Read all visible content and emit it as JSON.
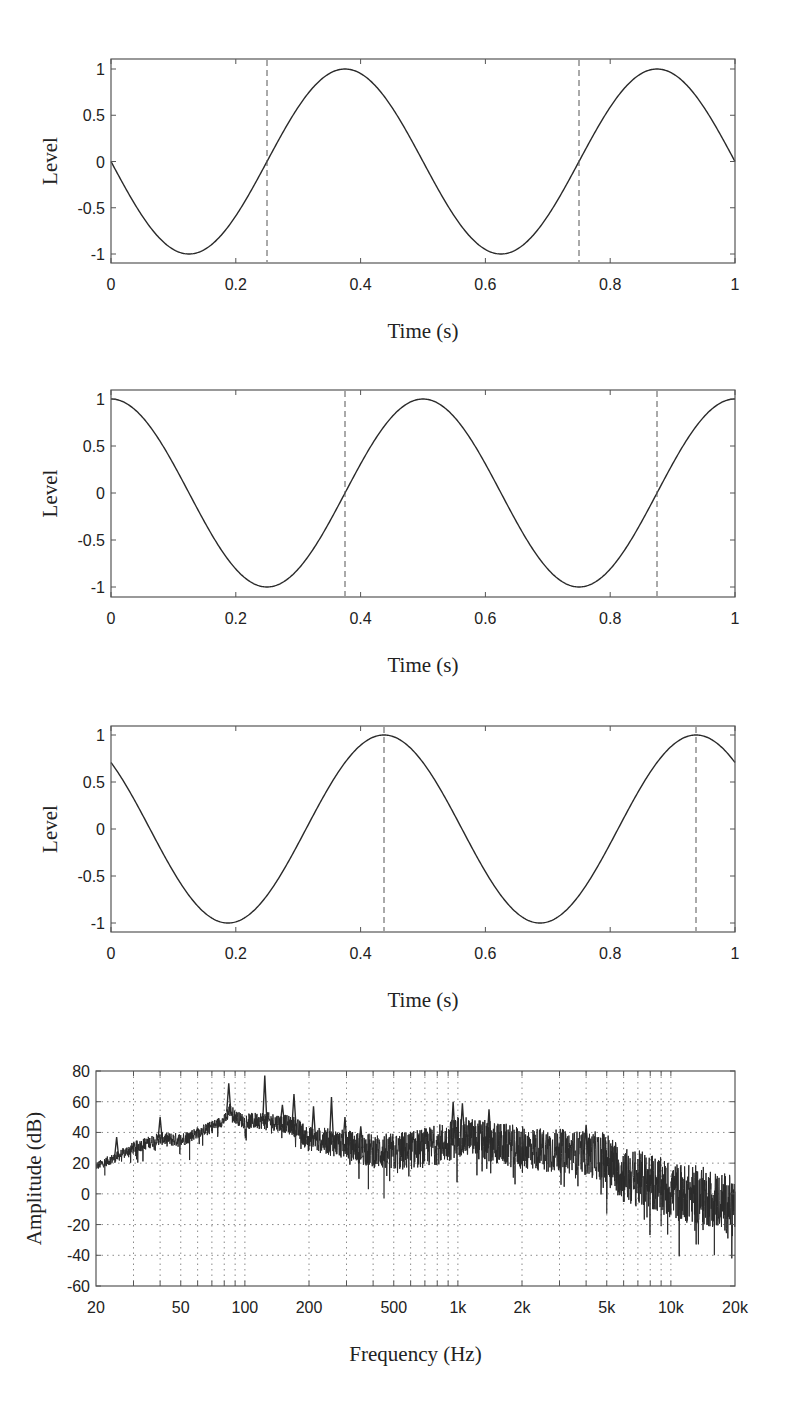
{
  "figure": {
    "width": 798,
    "height": 1401
  },
  "chart_data": [
    {
      "type": "line",
      "id": "waveform-1",
      "title": "",
      "xlabel": "Time (s)",
      "ylabel": "Level",
      "xlim": [
        0,
        1
      ],
      "ylim": [
        -1.1,
        1.1
      ],
      "xticks": [
        0,
        0.2,
        0.4,
        0.6,
        0.8,
        1
      ],
      "xtick_labels": [
        "0",
        "0.2",
        "0.4",
        "0.6",
        "0.8",
        "1"
      ],
      "yticks": [
        1,
        0.5,
        0,
        -0.5,
        -1
      ],
      "ytick_labels": [
        "1",
        "0.5",
        "0",
        "-0.5",
        "-1"
      ],
      "grid": false,
      "series": [
        {
          "name": "signal",
          "function": "-sin(2*pi*2*t)",
          "frequency_hz": 2,
          "amplitude": 1,
          "phase_rad": 3.14159265,
          "x": [
            0,
            0.125,
            0.25,
            0.375,
            0.5,
            0.625,
            0.75,
            0.875,
            1
          ],
          "values": [
            0,
            -1,
            0,
            1,
            0,
            -1,
            0,
            1,
            0
          ]
        }
      ],
      "markers": {
        "style": "dashed-vertical",
        "x": [
          0.25,
          0.75
        ]
      },
      "box": {
        "left": 111,
        "top": 59,
        "right": 735,
        "bottom": 263,
        "y_at_top_tick": 69,
        "y_at_bottom_tick": 254
      }
    },
    {
      "type": "line",
      "id": "waveform-2",
      "title": "",
      "xlabel": "Time (s)",
      "ylabel": "Level",
      "xlim": [
        0,
        1
      ],
      "ylim": [
        -1.1,
        1.1
      ],
      "xticks": [
        0,
        0.2,
        0.4,
        0.6,
        0.8,
        1
      ],
      "xtick_labels": [
        "0",
        "0.2",
        "0.4",
        "0.6",
        "0.8",
        "1"
      ],
      "yticks": [
        1,
        0.5,
        0,
        -0.5,
        -1
      ],
      "ytick_labels": [
        "1",
        "0.5",
        "0",
        "-0.5",
        "-1"
      ],
      "grid": false,
      "series": [
        {
          "name": "signal",
          "function": "cos(2*pi*2*t)",
          "frequency_hz": 2,
          "amplitude": 1,
          "phase_rad": 1.57079633,
          "x": [
            0,
            0.125,
            0.25,
            0.375,
            0.5,
            0.625,
            0.75,
            0.875,
            1
          ],
          "values": [
            1,
            0,
            -1,
            0,
            1,
            0,
            -1,
            0,
            1
          ]
        }
      ],
      "markers": {
        "style": "dashed-vertical",
        "x": [
          0.375,
          0.875
        ]
      },
      "box": {
        "left": 111,
        "top": 390,
        "right": 735,
        "bottom": 597,
        "y_at_top_tick": 399,
        "y_at_bottom_tick": 587
      }
    },
    {
      "type": "line",
      "id": "waveform-3",
      "title": "",
      "xlabel": "Time (s)",
      "ylabel": "Level",
      "xlim": [
        0,
        1
      ],
      "ylim": [
        -1.1,
        1.1
      ],
      "xticks": [
        0,
        0.2,
        0.4,
        0.6,
        0.8,
        1
      ],
      "xtick_labels": [
        "0",
        "0.2",
        "0.4",
        "0.6",
        "0.8",
        "1"
      ],
      "yticks": [
        1,
        0.5,
        0,
        -0.5,
        -1
      ],
      "ytick_labels": [
        "1",
        "0.5",
        "0",
        "-0.5",
        "-1"
      ],
      "grid": false,
      "series": [
        {
          "name": "signal",
          "function": "sin(2*pi*2*t + 3*pi/4)",
          "frequency_hz": 2,
          "amplitude": 1,
          "phase_rad": 2.35619449,
          "x": [
            0,
            0.0625,
            0.1875,
            0.3125,
            0.4375,
            0.5625,
            0.6875,
            0.8125,
            0.9375,
            1
          ],
          "values": [
            0.707,
            1,
            0,
            -1,
            0,
            1,
            0,
            -1,
            0,
            0.707
          ]
        }
      ],
      "markers": {
        "style": "dashed-vertical",
        "x": [
          0.4375,
          0.9375
        ]
      },
      "box": {
        "left": 111,
        "top": 726,
        "right": 735,
        "bottom": 932,
        "y_at_top_tick": 735,
        "y_at_bottom_tick": 923
      }
    },
    {
      "type": "line",
      "id": "spectrum",
      "title": "",
      "xlabel": "Frequency (Hz)",
      "ylabel": "Amplitude (dB)",
      "xscale": "log",
      "xlim": [
        20,
        20000
      ],
      "ylim": [
        -60,
        80
      ],
      "xticks": [
        20,
        50,
        100,
        200,
        500,
        1000,
        2000,
        5000,
        10000,
        20000
      ],
      "xtick_labels": [
        "20",
        "50",
        "100",
        "200",
        "500",
        "1k",
        "2k",
        "5k",
        "10k",
        "20k"
      ],
      "yticks": [
        80,
        60,
        40,
        20,
        0,
        -20,
        -40,
        -60
      ],
      "ytick_labels": [
        "80",
        "60",
        "40",
        "20",
        "0",
        "-20",
        "-40",
        "-60"
      ],
      "grid": true,
      "grid_style": "dotted",
      "minor_grid_x": [
        30,
        40,
        50,
        60,
        70,
        80,
        90,
        100,
        200,
        300,
        400,
        500,
        600,
        700,
        800,
        900,
        1000,
        2000,
        3000,
        4000,
        5000,
        6000,
        7000,
        8000,
        9000,
        10000
      ],
      "series": [
        {
          "name": "amplitude",
          "envelope": {
            "x": [
              20,
              25,
              30,
              40,
              50,
              60,
              70,
              80,
              85,
              90,
              100,
              120,
              150,
              170,
              200,
              300,
              400,
              500,
              700,
              900,
              1000,
              1500,
              2000,
              3000,
              4000,
              5000,
              6000,
              8000,
              10000,
              15000,
              20000
            ],
            "mean": [
              18,
              24,
              30,
              36,
              35,
              40,
              44,
              48,
              55,
              50,
              47,
              48,
              46,
              44,
              36,
              32,
              28,
              27,
              30,
              34,
              38,
              33,
              30,
              28,
              26,
              24,
              12,
              8,
              2,
              -2,
              -8
            ],
            "spread": [
              5,
              6,
              7,
              7,
              8,
              6,
              6,
              6,
              8,
              7,
              8,
              9,
              9,
              10,
              12,
              14,
              16,
              18,
              18,
              18,
              18,
              18,
              18,
              18,
              18,
              20,
              22,
              22,
              22,
              22,
              22
            ]
          },
          "peaks": [
            {
              "x": 25,
              "value": 37
            },
            {
              "x": 40,
              "value": 50
            },
            {
              "x": 84,
              "value": 72
            },
            {
              "x": 124,
              "value": 77
            },
            {
              "x": 150,
              "value": 58
            },
            {
              "x": 170,
              "value": 65
            },
            {
              "x": 210,
              "value": 57
            },
            {
              "x": 255,
              "value": 63
            },
            {
              "x": 295,
              "value": 50
            },
            {
              "x": 350,
              "value": 44
            },
            {
              "x": 950,
              "value": 60
            },
            {
              "x": 1050,
              "value": 59
            },
            {
              "x": 1400,
              "value": 55
            },
            {
              "x": 4000,
              "value": 45
            }
          ],
          "dips": [
            {
              "x": 22,
              "value": 12
            },
            {
              "x": 55,
              "value": 22
            },
            {
              "x": 380,
              "value": 3
            },
            {
              "x": 450,
              "value": -3
            },
            {
              "x": 5000,
              "value": -13
            },
            {
              "x": 9000,
              "value": -21
            },
            {
              "x": 16000,
              "value": -40
            }
          ]
        }
      ],
      "box": {
        "left": 96,
        "top": 1071,
        "right": 735,
        "bottom": 1286
      }
    }
  ],
  "styles": {
    "line_color": "#2a2a2a",
    "axis_color": "#555555",
    "grid_color": "#8a8a8a",
    "dashed_marker_color": "#555555"
  }
}
